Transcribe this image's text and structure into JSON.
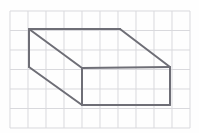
{
  "figure": {
    "canvas": {
      "width": 199,
      "height": 133,
      "background": "#fefefe"
    },
    "grid": {
      "visible": true,
      "origin_x": 10,
      "origin_y": 11,
      "cell_width": 18,
      "cell_height": 19.5,
      "columns": 10,
      "rows": 6,
      "line_color": "#d9d9dd",
      "line_width": 1
    },
    "shape": {
      "name": "rectangular-prism",
      "stroke_color": "#6e6e76",
      "stroke_width": 2,
      "fill": "none",
      "projection": "oblique",
      "vertices": {
        "back_top_left": [
          29,
          29
        ],
        "back_top_right": [
          120,
          29
        ],
        "front_top_left": [
          82,
          68
        ],
        "front_top_right": [
          170,
          67
        ],
        "front_bottom_left": [
          82,
          105
        ],
        "front_bottom_right": [
          170,
          105
        ],
        "back_bottom_left": [
          29,
          67
        ]
      },
      "edges": [
        {
          "name": "top-back-edge",
          "from": [
            29,
            29
          ],
          "to": [
            120,
            29
          ],
          "style": "solid"
        },
        {
          "name": "top-right-diagonal",
          "from": [
            120,
            29
          ],
          "to": [
            170,
            67
          ],
          "style": "solid"
        },
        {
          "name": "top-front-edge",
          "from": [
            170,
            67
          ],
          "to": [
            82,
            68
          ],
          "style": "solid"
        },
        {
          "name": "top-left-diagonal",
          "from": [
            82,
            68
          ],
          "to": [
            29,
            29
          ],
          "style": "solid"
        },
        {
          "name": "left-vertical-edge",
          "from": [
            29,
            29
          ],
          "to": [
            29,
            67
          ],
          "style": "solid"
        },
        {
          "name": "bottom-left-diagonal",
          "from": [
            29,
            67
          ],
          "to": [
            82,
            105
          ],
          "style": "solid"
        },
        {
          "name": "front-left-vertical",
          "from": [
            82,
            68
          ],
          "to": [
            82,
            105
          ],
          "style": "solid"
        },
        {
          "name": "front-bottom-edge",
          "from": [
            82,
            105
          ],
          "to": [
            170,
            105
          ],
          "style": "solid"
        },
        {
          "name": "front-right-vertical",
          "from": [
            170,
            67
          ],
          "to": [
            170,
            105
          ],
          "style": "solid"
        }
      ]
    }
  }
}
